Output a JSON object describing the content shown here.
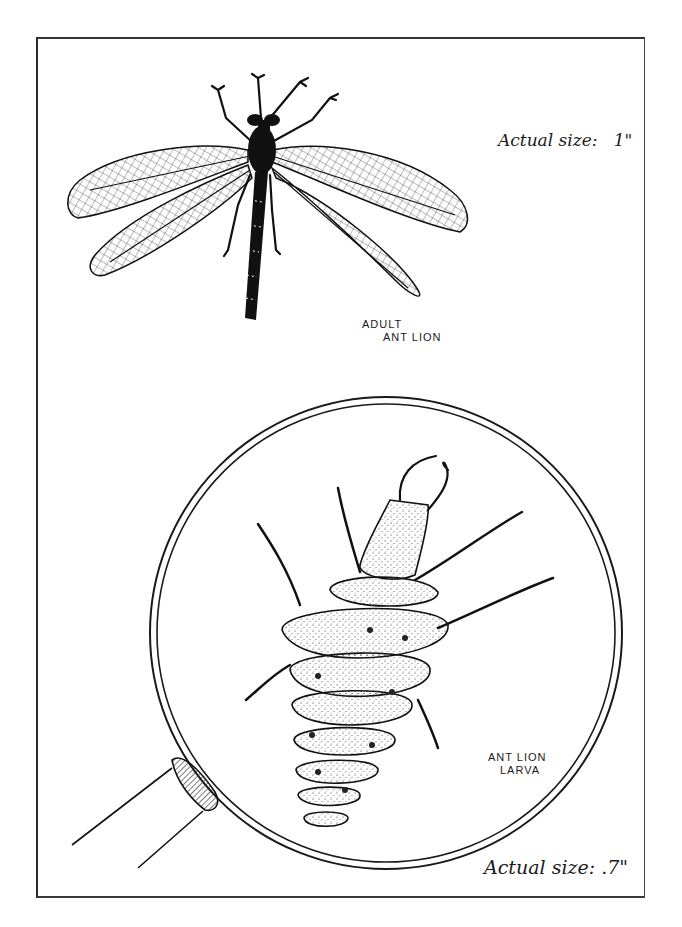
{
  "page": {
    "labels": {
      "adult_size": "Actual size:   1\"",
      "adult_name_line1": "ADULT",
      "adult_name_line2": "ANT LION",
      "larva_name_line1": "ANT LION",
      "larva_name_line2": "LARVA",
      "larva_size": "Actual size: .7\""
    },
    "illustrations": [
      {
        "name": "adult-ant-lion",
        "description": "ink drawing of adult ant lion with four net-veined wings"
      },
      {
        "name": "magnifying-glass",
        "description": "magnifying glass lens with handle at lower-left"
      },
      {
        "name": "ant-lion-larva",
        "description": "stippled larva with pincer jaws inside the lens"
      }
    ],
    "colors": {
      "ink": "#1a1a1a",
      "paper": "#ffffff",
      "frame": "#333333"
    }
  }
}
